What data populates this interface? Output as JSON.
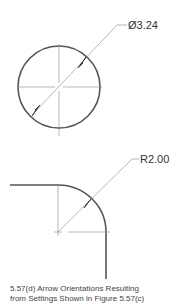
{
  "figure": {
    "circle_dimension": {
      "label": "Ø3.24",
      "type": "diameter"
    },
    "fillet_dimension": {
      "label": "R2.00",
      "type": "radius"
    },
    "caption": {
      "line1": "5.57(d)  Arrow Orientations Resulting",
      "line2": "from Settings Shown in Figure 5.57(c)"
    },
    "colors": {
      "object_line": "#555555",
      "thin_line": "#888888",
      "text": "#333333"
    }
  }
}
